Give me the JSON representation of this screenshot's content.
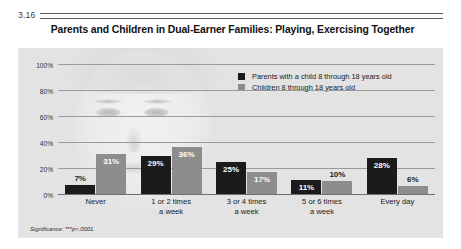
{
  "figure": {
    "number": "3.16",
    "title": "Parents and Children in Dual-Earner Families: Playing, Exercising Together",
    "significance_note": "Significance: ***p<.0001."
  },
  "legend": {
    "items": [
      {
        "label": "Parents with a child 8 through 18 years old",
        "color": "#1b1b1b",
        "swatch": "square-dark-icon"
      },
      {
        "label": "Children 8 through 18 years old",
        "color": "#8d8d8d",
        "swatch": "square-light-icon"
      }
    ]
  },
  "axis": {
    "yticks": [
      "100%",
      "80%",
      "60%",
      "40%",
      "20%",
      "0%"
    ],
    "yvalues": [
      100,
      80,
      60,
      40,
      20,
      0
    ]
  },
  "chart_data": {
    "type": "bar",
    "title": "Parents and Children in Dual-Earner Families: Playing, Exercising Together",
    "xlabel": "",
    "ylabel": "",
    "ylim": [
      0,
      100
    ],
    "grid": true,
    "legend_position": "top-right",
    "categories": [
      "Never",
      "1 or 2 times\na week",
      "3 or 4 times\na week",
      "5 or 6 times\na week",
      "Every day"
    ],
    "category_lines": [
      [
        "Never",
        ""
      ],
      [
        "1 or 2 times",
        "a week"
      ],
      [
        "3 or 4 times",
        "a week"
      ],
      [
        "5 or 6 times",
        "a week"
      ],
      [
        "Every day",
        ""
      ]
    ],
    "series": [
      {
        "name": "Parents with a child 8 through 18 years old",
        "color": "#1b1b1b",
        "values": [
          7,
          29,
          25,
          11,
          28
        ],
        "labels": [
          "7%",
          "29%",
          "25%",
          "11%",
          "28%"
        ]
      },
      {
        "name": "Children 8 through 18 years old",
        "color": "#8d8d8d",
        "values": [
          31,
          36,
          17,
          10,
          6
        ],
        "labels": [
          "31%",
          "36%",
          "17%",
          "10%",
          "6%"
        ]
      }
    ],
    "annotations": [
      "Significance: ***p<.0001."
    ]
  }
}
